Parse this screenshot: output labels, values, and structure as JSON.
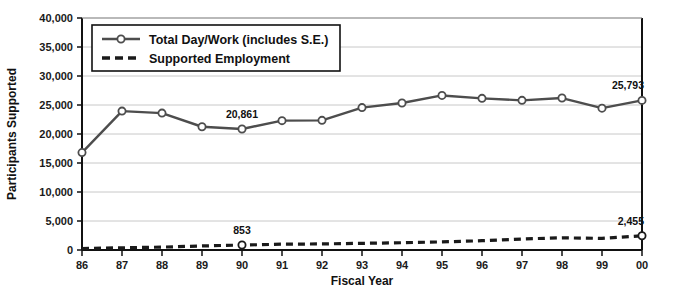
{
  "chart_data": {
    "type": "line",
    "title": "",
    "xlabel": "Fiscal Year",
    "ylabel": "Participants Supported",
    "categories": [
      "86",
      "87",
      "88",
      "89",
      "90",
      "91",
      "92",
      "93",
      "94",
      "95",
      "96",
      "97",
      "98",
      "99",
      "00"
    ],
    "ylim": [
      0,
      40000
    ],
    "ytick_values": [
      0,
      5000,
      10000,
      15000,
      20000,
      25000,
      30000,
      35000,
      40000
    ],
    "ytick_labels": [
      "0",
      "5,000",
      "10,000",
      "15,000",
      "20,000",
      "25,000",
      "30,000",
      "35,000",
      "40,000"
    ],
    "grid": true,
    "legend_position": "top-left",
    "series": [
      {
        "name": "Total Day/Work (includes S.E.)",
        "style": "solid",
        "marker": "circle",
        "color": "#4d4d4d",
        "values": [
          16800,
          23950,
          23600,
          21250,
          20861,
          22300,
          22350,
          24550,
          25350,
          26650,
          26150,
          25800,
          26200,
          24450,
          25793
        ]
      },
      {
        "name": "Supported Employment",
        "style": "dashed",
        "marker": "circle",
        "color": "#1a1a1a",
        "values": [
          250,
          380,
          500,
          700,
          853,
          1000,
          1050,
          1150,
          1250,
          1400,
          1600,
          1900,
          2100,
          2000,
          2455
        ]
      }
    ],
    "annotations": [
      {
        "text": "20,861",
        "series": "Total Day/Work (includes S.E.)",
        "category": "90",
        "value": 20861
      },
      {
        "text": "25,793",
        "series": "Total Day/Work (includes S.E.)",
        "category": "00",
        "value": 25793
      },
      {
        "text": "853",
        "series": "Supported Employment",
        "category": "90",
        "value": 853
      },
      {
        "text": "2,455",
        "series": "Supported Employment",
        "category": "00",
        "value": 2455
      }
    ]
  },
  "legend": {
    "items": [
      {
        "label": "Total Day/Work (includes S.E.)",
        "style": "solid"
      },
      {
        "label": "Supported Employment",
        "style": "dashed"
      }
    ]
  },
  "axes": {
    "x_title": "Fiscal Year",
    "y_title": "Participants Supported"
  }
}
